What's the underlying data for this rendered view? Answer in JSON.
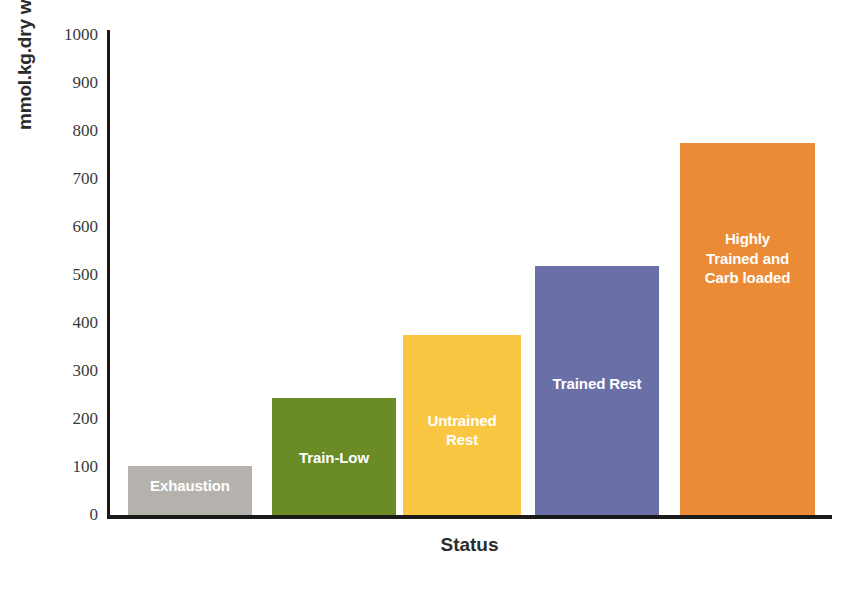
{
  "chart_data": {
    "type": "bar",
    "title": "",
    "xlabel": "Status",
    "ylabel": "mmol.kg.dry weight",
    "categories": [
      "Exhaustion",
      "Train-Low",
      "Untrained Rest",
      "Trained Rest",
      "Highly Trained and Carb loaded"
    ],
    "values": [
      102,
      244,
      374,
      519,
      774
    ],
    "ylim": [
      0,
      1000
    ],
    "y_ticks": [
      0,
      100,
      200,
      300,
      400,
      500,
      600,
      700,
      800,
      900,
      1000
    ],
    "grid": false,
    "legend": "none",
    "bar_colors": [
      "#b5b2ad",
      "#6b8b27",
      "#fac742",
      "#6b6fa8",
      "#ec8b36"
    ],
    "bar_label_color": "#ffffff",
    "axis_color": "#1a1a1a",
    "background": "#ffffff",
    "bars": [
      {
        "category": "Exhaustion",
        "label": "Exhaustion",
        "value": 102,
        "color": "#b5b2ad",
        "label_lines": 1,
        "label_bottom_offset": 20
      },
      {
        "category": "Train-Low",
        "label": "Train-Low",
        "value": 244,
        "color": "#6b8b27",
        "label_lines": 1,
        "label_bottom_offset": 48
      },
      {
        "category": "Untrained Rest",
        "label": "Untrained\nRest",
        "value": 374,
        "color": "#fac742",
        "label_lines": 2,
        "label_bottom_offset": 66
      },
      {
        "category": "Trained Rest",
        "label": "Trained Rest",
        "value": 519,
        "color": "#6b6fa8",
        "label_lines": 1,
        "label_bottom_offset": 122
      },
      {
        "category": "Highly Trained and Carb loaded",
        "label": "Highly\nTrained and\nCarb loaded",
        "value": 774,
        "color": "#ec8b36",
        "label_lines": 3,
        "label_bottom_offset": 228
      }
    ]
  },
  "axes": {
    "y_title": "mmol.kg.dry weight",
    "x_title": "Status",
    "y_tick_labels": [
      "1000",
      "900",
      "800",
      "700",
      "600",
      "500",
      "400",
      "300",
      "200",
      "100",
      "0"
    ]
  }
}
